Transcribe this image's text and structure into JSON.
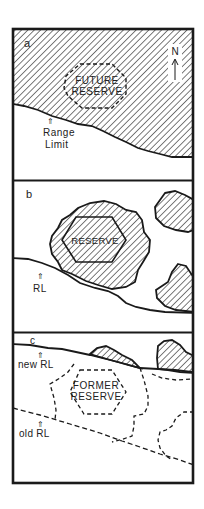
{
  "figure": {
    "panels": [
      {
        "id": "a",
        "label": "a",
        "reserve_label_line1": "FUTURE",
        "reserve_label_line2": "RESERVE",
        "boundary_label_line1": "Range",
        "boundary_label_line2": "Limit",
        "boundary_arrow": "⇑",
        "north_label": "N"
      },
      {
        "id": "b",
        "label": "b",
        "reserve_label": "RESERVE",
        "boundary_label": "RL",
        "boundary_arrow": "⇑"
      },
      {
        "id": "c",
        "label": "c",
        "reserve_label_line1": "FORMER",
        "reserve_label_line2": "RESERVE",
        "new_boundary_label": "new RL",
        "old_boundary_label": "old RL",
        "boundary_arrow": "⇑"
      }
    ],
    "colors": {
      "ink": "#1a1a1a",
      "hatch": "#333333",
      "background": "#ffffff"
    }
  }
}
